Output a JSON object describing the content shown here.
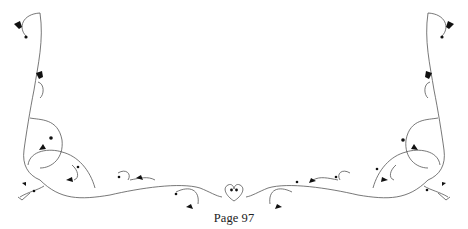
{
  "page": {
    "number_label": "Page 97"
  },
  "ornament": {
    "style": "floral-vine-border",
    "icons": [
      "heart-leaf-icon",
      "center-heart-icon",
      "berry-dot-icon"
    ],
    "stroke_color": "#555555",
    "fill_color": "#111111",
    "background": "#ffffff"
  }
}
